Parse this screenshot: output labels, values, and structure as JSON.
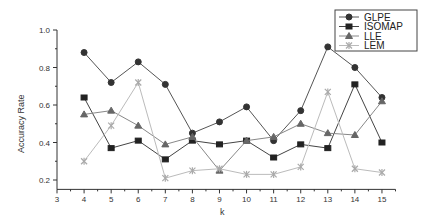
{
  "chart_data": {
    "type": "line",
    "title": "",
    "xlabel": "k",
    "ylabel": "Accuracy Rate",
    "x": [
      4,
      5,
      6,
      7,
      8,
      9,
      10,
      11,
      12,
      13,
      14,
      15
    ],
    "xlim": [
      3,
      15.5
    ],
    "ylim": [
      0.15,
      1.0
    ],
    "xticks": [
      3,
      4,
      5,
      6,
      7,
      8,
      9,
      10,
      11,
      12,
      13,
      14,
      15
    ],
    "yticks": [
      0.2,
      0.4,
      0.6,
      0.8,
      1.0
    ],
    "ytick_labels": [
      "0.2",
      "0.4",
      "0.6",
      "0.8",
      "1.0"
    ],
    "grid": false,
    "legend_position": "upper right",
    "series": [
      {
        "name": "GLPE",
        "marker": "circle",
        "color": "#555555",
        "markerColor": "#333333",
        "values": [
          0.88,
          0.72,
          0.83,
          0.71,
          0.45,
          0.51,
          0.59,
          0.41,
          0.57,
          0.91,
          0.8,
          0.64
        ]
      },
      {
        "name": "ISOMAP",
        "marker": "square",
        "color": "#444444",
        "markerColor": "#222222",
        "values": [
          0.64,
          0.37,
          0.41,
          0.31,
          0.41,
          0.39,
          0.41,
          0.32,
          0.39,
          0.37,
          0.71,
          0.4
        ]
      },
      {
        "name": "LLE",
        "marker": "triangle",
        "color": "#888888",
        "markerColor": "#666666",
        "values": [
          0.55,
          0.57,
          0.49,
          0.39,
          0.43,
          0.25,
          0.41,
          0.43,
          0.5,
          0.45,
          0.44,
          0.62
        ]
      },
      {
        "name": "LEM",
        "marker": "star",
        "color": "#bbbbbb",
        "markerColor": "#aaaaaa",
        "values": [
          0.3,
          0.49,
          0.72,
          0.21,
          0.25,
          0.26,
          0.23,
          0.23,
          0.27,
          0.67,
          0.26,
          0.24
        ]
      }
    ]
  }
}
